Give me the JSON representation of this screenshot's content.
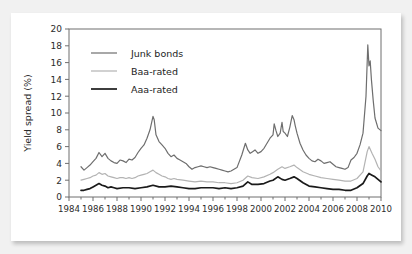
{
  "figure": {
    "background_color": "#f1f1f1",
    "card_color": "#ffffff",
    "frame_color": "#6f6f6f"
  },
  "chart_data": {
    "type": "line",
    "title": "",
    "xlabel": "",
    "ylabel": "Yield spread (%)",
    "ylim": [
      0,
      20
    ],
    "xlim": [
      1984,
      2010
    ],
    "ytick_labels": [
      "0",
      "2",
      "4",
      "6",
      "8",
      "10",
      "12",
      "14",
      "16",
      "18",
      "20"
    ],
    "ytick_values": [
      0,
      2,
      4,
      6,
      8,
      10,
      12,
      14,
      16,
      18,
      20
    ],
    "xtick_labels": [
      "1984",
      "1986",
      "1988",
      "1990",
      "1992",
      "1994",
      "1996",
      "1998",
      "2000",
      "2002",
      "2004",
      "2006",
      "2008",
      "2010"
    ],
    "xtick_values": [
      1984,
      1986,
      1988,
      1990,
      1992,
      1994,
      1996,
      1998,
      2000,
      2002,
      2004,
      2006,
      2008,
      2010
    ],
    "grid": false,
    "legend_position": "upper-left",
    "colors": {
      "junk": "#6e6e6e",
      "baa": "#b3b3b3",
      "aaa": "#1a1a1a"
    },
    "series": [
      {
        "name": "Junk bonds",
        "color": "#6e6e6e",
        "width": 1.2,
        "x": [
          1985.0,
          1985.25,
          1985.5,
          1985.75,
          1986.0,
          1986.25,
          1986.5,
          1986.75,
          1987.0,
          1987.25,
          1987.5,
          1987.75,
          1988.0,
          1988.25,
          1988.5,
          1988.75,
          1989.0,
          1989.25,
          1989.5,
          1989.75,
          1990.0,
          1990.25,
          1990.5,
          1990.75,
          1991.0,
          1991.1,
          1991.25,
          1991.5,
          1991.75,
          1992.0,
          1992.25,
          1992.5,
          1992.75,
          1993.0,
          1993.25,
          1993.5,
          1993.75,
          1994.0,
          1994.25,
          1994.5,
          1994.75,
          1995.0,
          1995.25,
          1995.5,
          1995.75,
          1996.0,
          1996.25,
          1996.5,
          1996.75,
          1997.0,
          1997.25,
          1997.5,
          1997.75,
          1998.0,
          1998.4,
          1998.7,
          1998.9,
          1999.1,
          1999.3,
          1999.5,
          1999.75,
          2000.0,
          2000.25,
          2000.5,
          2000.75,
          2001.0,
          2001.1,
          2001.25,
          2001.4,
          2001.6,
          2001.75,
          2001.85,
          2002.0,
          2002.2,
          2002.4,
          2002.6,
          2002.75,
          2002.85,
          2003.0,
          2003.25,
          2003.5,
          2003.75,
          2004.0,
          2004.25,
          2004.5,
          2004.75,
          2005.0,
          2005.25,
          2005.5,
          2005.75,
          2006.0,
          2006.25,
          2006.5,
          2006.75,
          2007.0,
          2007.25,
          2007.5,
          2007.75,
          2008.0,
          2008.25,
          2008.5,
          2008.75,
          2008.9,
          2009.0,
          2009.1,
          2009.2,
          2009.35,
          2009.5,
          2009.75,
          2010.0
        ],
        "y": [
          3.6,
          3.2,
          3.5,
          3.8,
          4.2,
          4.6,
          5.3,
          4.8,
          5.2,
          4.6,
          4.3,
          4.1,
          4.0,
          4.4,
          4.3,
          4.1,
          4.5,
          4.4,
          4.7,
          5.3,
          5.8,
          6.2,
          7.0,
          8.0,
          9.6,
          9.2,
          7.4,
          6.6,
          6.2,
          5.8,
          5.2,
          4.8,
          5.0,
          4.6,
          4.4,
          4.2,
          4.0,
          3.6,
          3.3,
          3.5,
          3.6,
          3.7,
          3.6,
          3.5,
          3.6,
          3.5,
          3.4,
          3.3,
          3.2,
          3.1,
          3.0,
          3.1,
          3.3,
          3.5,
          5.0,
          6.4,
          5.6,
          5.2,
          5.4,
          5.6,
          5.2,
          5.4,
          5.8,
          6.4,
          7.0,
          7.4,
          8.7,
          7.9,
          7.2,
          7.6,
          8.9,
          7.8,
          7.6,
          7.2,
          8.3,
          9.7,
          9.2,
          8.5,
          7.6,
          6.4,
          5.6,
          5.0,
          4.6,
          4.3,
          4.2,
          4.5,
          4.3,
          4.0,
          4.1,
          4.2,
          3.9,
          3.6,
          3.5,
          3.4,
          3.3,
          3.5,
          4.4,
          4.7,
          5.2,
          6.2,
          7.6,
          12.0,
          18.1,
          15.6,
          16.2,
          14.0,
          11.5,
          9.4,
          8.2,
          7.9
        ]
      },
      {
        "name": "Baa-rated",
        "color": "#b3b3b3",
        "width": 1.2,
        "x": [
          1985.0,
          1985.25,
          1985.5,
          1985.75,
          1986.0,
          1986.25,
          1986.5,
          1986.75,
          1987.0,
          1987.25,
          1987.5,
          1987.75,
          1988.0,
          1988.25,
          1988.5,
          1988.75,
          1989.0,
          1989.25,
          1989.5,
          1989.75,
          1990.0,
          1990.25,
          1990.5,
          1990.75,
          1991.0,
          1991.25,
          1991.5,
          1991.75,
          1992.0,
          1992.25,
          1992.5,
          1992.75,
          1993.0,
          1993.5,
          1994.0,
          1994.5,
          1995.0,
          1995.5,
          1996.0,
          1996.5,
          1997.0,
          1997.5,
          1998.0,
          1998.5,
          1998.9,
          1999.25,
          1999.75,
          2000.25,
          2000.75,
          2001.0,
          2001.4,
          2001.75,
          2002.0,
          2002.4,
          2002.75,
          2003.0,
          2003.5,
          2004.0,
          2004.5,
          2005.0,
          2005.5,
          2006.0,
          2006.5,
          2007.0,
          2007.5,
          2008.0,
          2008.5,
          2008.85,
          2009.0,
          2009.25,
          2009.5,
          2009.75,
          2010.0
        ],
        "y": [
          2.0,
          2.1,
          2.2,
          2.3,
          2.5,
          2.6,
          2.9,
          2.7,
          2.8,
          2.5,
          2.4,
          2.3,
          2.2,
          2.3,
          2.3,
          2.2,
          2.3,
          2.2,
          2.3,
          2.5,
          2.6,
          2.7,
          2.8,
          3.0,
          3.2,
          2.9,
          2.7,
          2.5,
          2.4,
          2.2,
          2.1,
          2.2,
          2.1,
          2.0,
          1.9,
          1.8,
          1.9,
          1.8,
          1.8,
          1.7,
          1.7,
          1.6,
          1.7,
          2.0,
          2.5,
          2.3,
          2.2,
          2.4,
          2.7,
          2.9,
          3.3,
          3.6,
          3.4,
          3.6,
          3.8,
          3.5,
          3.0,
          2.7,
          2.5,
          2.3,
          2.2,
          2.1,
          2.0,
          1.9,
          1.9,
          2.2,
          3.0,
          5.4,
          6.0,
          5.2,
          4.5,
          3.6,
          3.1
        ]
      },
      {
        "name": "Aaa-rated",
        "color": "#1a1a1a",
        "width": 1.7,
        "x": [
          1985.0,
          1985.25,
          1985.5,
          1985.75,
          1986.0,
          1986.25,
          1986.5,
          1986.75,
          1987.0,
          1987.25,
          1987.5,
          1987.75,
          1988.0,
          1988.5,
          1989.0,
          1989.5,
          1990.0,
          1990.5,
          1991.0,
          1991.5,
          1992.0,
          1992.5,
          1993.0,
          1993.5,
          1994.0,
          1994.5,
          1995.0,
          1995.5,
          1996.0,
          1996.5,
          1997.0,
          1997.5,
          1998.0,
          1998.5,
          1998.9,
          1999.25,
          1999.75,
          2000.25,
          2000.75,
          2001.0,
          2001.4,
          2001.75,
          2002.0,
          2002.4,
          2002.75,
          2003.0,
          2003.5,
          2004.0,
          2004.5,
          2005.0,
          2005.5,
          2006.0,
          2006.5,
          2007.0,
          2007.5,
          2008.0,
          2008.5,
          2008.85,
          2009.0,
          2009.25,
          2009.5,
          2009.75,
          2010.0
        ],
        "y": [
          0.8,
          0.8,
          0.9,
          1.0,
          1.2,
          1.4,
          1.6,
          1.4,
          1.3,
          1.1,
          1.2,
          1.1,
          1.0,
          1.1,
          1.1,
          1.0,
          1.1,
          1.2,
          1.4,
          1.2,
          1.2,
          1.3,
          1.2,
          1.1,
          1.0,
          1.0,
          1.1,
          1.1,
          1.1,
          1.0,
          1.1,
          1.0,
          1.1,
          1.3,
          1.8,
          1.5,
          1.5,
          1.6,
          1.9,
          2.0,
          2.4,
          2.1,
          2.0,
          2.2,
          2.4,
          2.2,
          1.7,
          1.3,
          1.2,
          1.1,
          1.0,
          0.9,
          0.9,
          0.8,
          0.8,
          1.1,
          1.6,
          2.5,
          2.8,
          2.6,
          2.4,
          2.1,
          1.8
        ]
      }
    ]
  },
  "legend": {
    "items": [
      {
        "label": "Junk bonds"
      },
      {
        "label": "Baa-rated"
      },
      {
        "label": "Aaa-rated"
      }
    ]
  }
}
